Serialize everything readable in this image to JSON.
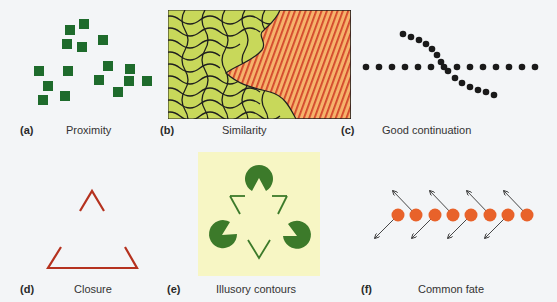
{
  "figure": {
    "panels": [
      {
        "id": "a",
        "letter": "(a)",
        "caption": "Proximity"
      },
      {
        "id": "b",
        "letter": "(b)",
        "caption": "Similarity"
      },
      {
        "id": "c",
        "letter": "(c)",
        "caption": "Good continuation"
      },
      {
        "id": "d",
        "letter": "(d)",
        "caption": "Closure"
      },
      {
        "id": "e",
        "letter": "(e)",
        "caption": "Illusory contours"
      },
      {
        "id": "f",
        "letter": "(f)",
        "caption": "Common fate"
      }
    ],
    "colors": {
      "background": "#f3f5f7",
      "proximity_square": "#1e6b2c",
      "similarity_green": "#c8d85a",
      "similarity_orange": "#f6b26b",
      "similarity_stripe": "#d2452a",
      "contour_line": "#1f1f1f",
      "closure_red": "#b5321f",
      "kanizsa_bg": "#f7f6c4",
      "kanizsa_green": "#3c7a2a",
      "fate_orange": "#e8622a",
      "arrow": "#333333"
    }
  }
}
